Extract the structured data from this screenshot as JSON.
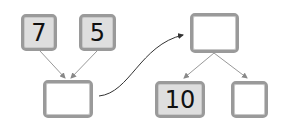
{
  "diagram": {
    "top_left_boxes": [
      {
        "value": "7",
        "filled": true
      },
      {
        "value": "5",
        "filled": true
      }
    ],
    "sum_box": {
      "value": "",
      "filled": false
    },
    "result_box": {
      "value": "",
      "filled": false
    },
    "split_boxes": [
      {
        "value": "10",
        "filled": true
      },
      {
        "value": "",
        "filled": false
      }
    ],
    "colors": {
      "box_border": "#9a9a9a",
      "filled_bg": "#dedede",
      "arrow": "#888888",
      "curve": "#333333"
    }
  }
}
